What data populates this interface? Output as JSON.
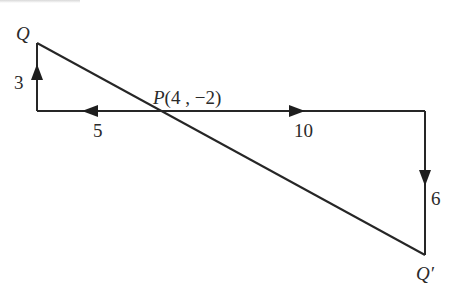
{
  "diagram": {
    "type": "vector translation diagram",
    "points": {
      "Q": {
        "label": "Q"
      },
      "P": {
        "label": "P(4 , −2)"
      },
      "Q_prime": {
        "label": "Q′"
      }
    },
    "segments": [
      {
        "label": "3",
        "direction": "up"
      },
      {
        "label": "5",
        "direction": "left"
      },
      {
        "label": "10",
        "direction": "right"
      },
      {
        "label": "6",
        "direction": "down"
      }
    ],
    "colors": {
      "stroke": "#262626",
      "text": "#2a2a2a",
      "background": "#ffffff"
    }
  }
}
